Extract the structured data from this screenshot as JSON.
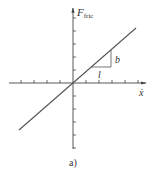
{
  "figure": {
    "caption": "a)",
    "y_axis_label": "F",
    "y_axis_subscript": "fric",
    "x_axis_label": "ẋ",
    "triangle_labels": {
      "vertical": "b",
      "horizontal": "l"
    },
    "colors": {
      "line": "#555555",
      "axis": "#444444",
      "text": "#333333",
      "background": "#ffffff"
    }
  },
  "diagram": {
    "type": "friction-velocity linear relation",
    "origin": [
      73,
      83
    ],
    "tick_spacing": 13,
    "x_ticks_left": 4,
    "x_ticks_right": 5,
    "y_ticks_up": 5,
    "y_ticks_down": 5,
    "line": {
      "from": [
        19,
        130
      ],
      "to": [
        136,
        28
      ]
    },
    "slope_triangle": {
      "p1": [
        91,
        67
      ],
      "p2": [
        111,
        67
      ],
      "p3": [
        111,
        50
      ]
    }
  }
}
